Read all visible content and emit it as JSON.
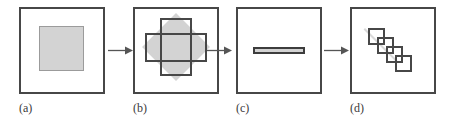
{
  "figure": {
    "background_color": "#ffffff",
    "frame_border_color": "#474747",
    "shape_fill_color": "#d3d3d3",
    "shape_outline_color": "#474747",
    "arrow_color": "#555555",
    "caption_color": "#3a3a3a"
  },
  "panels": [
    {
      "id": "a",
      "caption": "(a)",
      "content_description": "solid light-gray square centered in frame",
      "shapes": [
        {
          "name": "gray-square",
          "type": "square",
          "fill": "#d3d3d3",
          "stroke": "#9b9b9b"
        }
      ]
    },
    {
      "id": "b",
      "caption": "(b)",
      "content_description": "gray diamond overlaid by one tall vertical rectangle outline and one wide horizontal rectangle outline",
      "shapes": [
        {
          "name": "gray-diamond",
          "type": "diamond",
          "fill": "#d3d3d3",
          "stroke": "none"
        },
        {
          "name": "vertical-rectangle",
          "type": "rectangle",
          "fill": "none",
          "stroke": "#474747"
        },
        {
          "name": "horizontal-rectangle",
          "type": "rectangle",
          "fill": "none",
          "stroke": "#474747"
        }
      ]
    },
    {
      "id": "c",
      "caption": "(c)",
      "content_description": "thin horizontal gray bar with dark outline centered in frame",
      "shapes": [
        {
          "name": "thin-horizontal-bar",
          "type": "rectangle",
          "fill": "#d3d3d3",
          "stroke": "#3d3d3d"
        }
      ]
    },
    {
      "id": "d",
      "caption": "(d)",
      "content_description": "four small outlined squares chained along a diagonal from upper-left to lower-right over a faint gray diagonal line",
      "shapes": [
        {
          "name": "diagonal-guide-line",
          "type": "line",
          "fill": "none",
          "stroke": "#d9d9d9"
        },
        {
          "name": "small-square-1",
          "type": "square",
          "fill": "none",
          "stroke": "#474747"
        },
        {
          "name": "small-square-2",
          "type": "square",
          "fill": "none",
          "stroke": "#474747"
        },
        {
          "name": "small-square-3",
          "type": "square",
          "fill": "none",
          "stroke": "#474747"
        },
        {
          "name": "small-square-4",
          "type": "square",
          "fill": "none",
          "stroke": "#474747"
        }
      ]
    }
  ],
  "arrows": [
    {
      "id": "arrow-a-to-b",
      "from": "a",
      "to": "b",
      "direction": "right"
    },
    {
      "id": "arrow-b-to-c",
      "from": "b",
      "to": "c",
      "direction": "right"
    },
    {
      "id": "arrow-c-to-d",
      "from": "c",
      "to": "d",
      "direction": "right"
    }
  ]
}
